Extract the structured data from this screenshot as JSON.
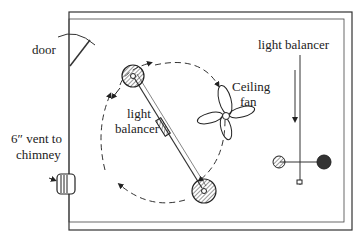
{
  "diagram": {
    "type": "room airflow plan",
    "labels": {
      "door": "door",
      "vent_line1": "6″ vent to",
      "vent_line2": "chimney",
      "light_balancer_left_line1": "light",
      "light_balancer_left_line2": "balancer",
      "ceiling_fan_line1": "Ceiling",
      "ceiling_fan_line2": "fan",
      "light_balancer_right": "light balancer"
    },
    "elements": [
      "room-walls",
      "door",
      "vent",
      "ceiling-fan",
      "light-balancer-diagonal",
      "light-balancer-horizontal",
      "airflow-circle"
    ],
    "colors": {
      "ink": "#222222",
      "background": "#ffffff"
    }
  }
}
